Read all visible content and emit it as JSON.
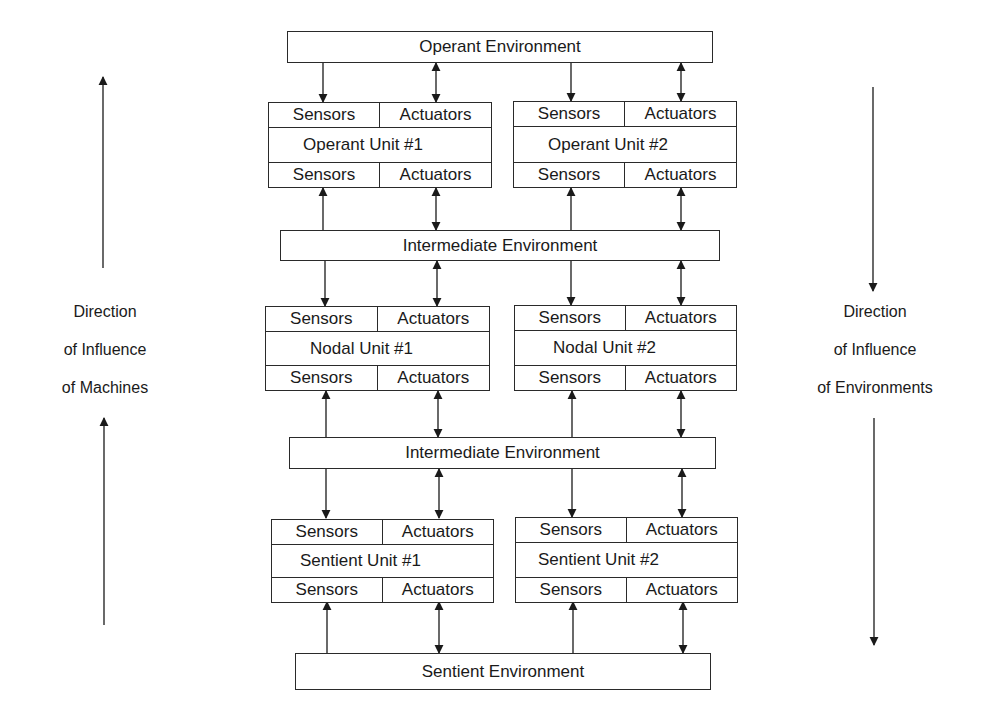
{
  "diagram": {
    "environments": {
      "operant": "Operant Environment",
      "intermediate_upper": "Intermediate Environment",
      "intermediate_lower": "Intermediate Environment",
      "sentient": "Sentient Environment"
    },
    "units": {
      "operant_1": {
        "top_sensors": "Sensors",
        "top_actuators": "Actuators",
        "name": "Operant Unit #1",
        "bottom_sensors": "Sensors",
        "bottom_actuators": "Actuators"
      },
      "operant_2": {
        "top_sensors": "Sensors",
        "top_actuators": "Actuators",
        "name": "Operant Unit #2",
        "bottom_sensors": "Sensors",
        "bottom_actuators": "Actuators"
      },
      "nodal_1": {
        "top_sensors": "Sensors",
        "top_actuators": "Actuators",
        "name": "Nodal Unit #1",
        "bottom_sensors": "Sensors",
        "bottom_actuators": "Actuators"
      },
      "nodal_2": {
        "top_sensors": "Sensors",
        "top_actuators": "Actuators",
        "name": "Nodal Unit #2",
        "bottom_sensors": "Sensors",
        "bottom_actuators": "Actuators"
      },
      "sentient_1": {
        "top_sensors": "Sensors",
        "top_actuators": "Actuators",
        "name": "Sentient Unit #1",
        "bottom_sensors": "Sensors",
        "bottom_actuators": "Actuators"
      },
      "sentient_2": {
        "top_sensors": "Sensors",
        "top_actuators": "Actuators",
        "name": "Sentient Unit #2",
        "bottom_sensors": "Sensors",
        "bottom_actuators": "Actuators"
      }
    },
    "left_label": {
      "line1": "Direction",
      "line2": "of Influence",
      "line3": "of Machines"
    },
    "right_label": {
      "line1": "Direction",
      "line2": "of Influence",
      "line3": "of Environments"
    }
  }
}
